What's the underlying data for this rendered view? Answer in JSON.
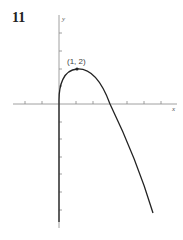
{
  "problem_number": "11",
  "graph": {
    "x_axis_label": "x",
    "y_axis_label": "y",
    "point_label": "(1, 2)",
    "point": [
      1,
      2
    ],
    "x_intercept_approx": 3
  }
}
